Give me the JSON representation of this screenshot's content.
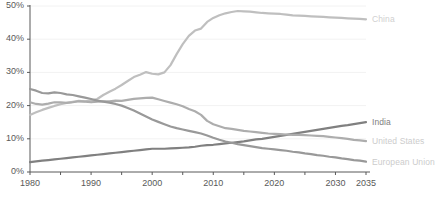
{
  "chart_data": {
    "type": "line",
    "title": "",
    "xlabel": "",
    "ylabel": "",
    "xlim": [
      1980,
      2035
    ],
    "ylim": [
      0,
      50
    ],
    "grid": true,
    "grid_axis": "y",
    "legend_position": "right-inline-end-of-line",
    "y_tick_labels": [
      "0%",
      "10%",
      "20%",
      "30%",
      "40%",
      "50%"
    ],
    "y_ticks": [
      0,
      10,
      20,
      30,
      40,
      50
    ],
    "x_tick_labels": [
      "1980",
      "1990",
      "2000",
      "2010",
      "2020",
      "2030",
      "2035"
    ],
    "x_ticks": [
      1980,
      1990,
      2000,
      2010,
      2020,
      2030,
      2035
    ],
    "x_minor_tick_step": 5,
    "value_unit": "percent",
    "x": [
      1980,
      1981,
      1982,
      1983,
      1984,
      1985,
      1986,
      1987,
      1988,
      1989,
      1990,
      1991,
      1992,
      1993,
      1994,
      1995,
      1996,
      1997,
      1998,
      1999,
      2000,
      2001,
      2002,
      2003,
      2004,
      2005,
      2006,
      2007,
      2008,
      2009,
      2010,
      2011,
      2012,
      2013,
      2014,
      2015,
      2016,
      2017,
      2018,
      2019,
      2020,
      2021,
      2022,
      2023,
      2024,
      2025,
      2026,
      2027,
      2028,
      2029,
      2030,
      2031,
      2032,
      2033,
      2034,
      2035
    ],
    "series": [
      {
        "name": "China",
        "color": "#bfbfbf",
        "label": "China",
        "label_color": "#d0d0d0",
        "values": [
          17.2,
          18.0,
          18.7,
          19.3,
          19.9,
          20.4,
          20.8,
          21.1,
          21.4,
          21.3,
          21.5,
          22.0,
          23.2,
          24.2,
          25.1,
          26.2,
          27.4,
          28.6,
          29.3,
          30.1,
          29.6,
          29.4,
          30.0,
          32.2,
          35.5,
          38.5,
          41.0,
          42.6,
          43.2,
          45.2,
          46.4,
          47.2,
          47.8,
          48.2,
          48.5,
          48.4,
          48.3,
          48.1,
          47.9,
          47.8,
          47.7,
          47.6,
          47.4,
          47.2,
          47.1,
          47.0,
          46.9,
          46.8,
          46.7,
          46.6,
          46.5,
          46.4,
          46.3,
          46.2,
          46.1,
          46.0
        ]
      },
      {
        "name": "India",
        "color": "#808080",
        "label": "India",
        "label_color": "#808080",
        "values": [
          3.0,
          3.2,
          3.4,
          3.6,
          3.8,
          4.0,
          4.2,
          4.4,
          4.6,
          4.8,
          5.0,
          5.2,
          5.4,
          5.6,
          5.8,
          6.0,
          6.2,
          6.4,
          6.6,
          6.8,
          7.0,
          7.0,
          7.0,
          7.1,
          7.2,
          7.3,
          7.4,
          7.6,
          7.9,
          8.1,
          8.2,
          8.4,
          8.6,
          8.8,
          9.0,
          9.2,
          9.5,
          9.8,
          10.0,
          10.3,
          10.6,
          10.9,
          11.2,
          11.5,
          11.8,
          12.1,
          12.4,
          12.7,
          13.0,
          13.3,
          13.6,
          13.9,
          14.1,
          14.4,
          14.7,
          15.0
        ]
      },
      {
        "name": "United States",
        "color": "#adadad",
        "label": "United States",
        "label_color": "#cccccc",
        "values": [
          21.0,
          20.5,
          20.3,
          20.6,
          21.0,
          21.0,
          20.8,
          21.0,
          21.3,
          21.2,
          21.0,
          21.2,
          21.3,
          21.3,
          21.5,
          21.4,
          21.7,
          22.0,
          22.2,
          22.3,
          22.4,
          21.9,
          21.4,
          20.9,
          20.4,
          19.8,
          19.0,
          18.3,
          17.2,
          15.4,
          14.4,
          13.8,
          13.2,
          13.0,
          12.7,
          12.4,
          12.2,
          12.0,
          11.8,
          11.6,
          11.5,
          11.4,
          11.3,
          11.2,
          11.2,
          11.1,
          11.0,
          10.9,
          10.8,
          10.6,
          10.4,
          10.2,
          10.0,
          9.7,
          9.5,
          9.3
        ]
      },
      {
        "name": "European Union",
        "color": "#999999",
        "label": "European Union",
        "label_color": "#cccccc",
        "values": [
          25.0,
          24.5,
          23.8,
          23.7,
          24.0,
          23.8,
          23.4,
          23.2,
          22.8,
          22.4,
          22.0,
          21.5,
          21.2,
          20.9,
          20.5,
          20.0,
          19.3,
          18.5,
          17.6,
          16.7,
          15.8,
          15.1,
          14.4,
          13.7,
          13.2,
          12.8,
          12.4,
          12.0,
          11.6,
          11.0,
          10.3,
          9.7,
          9.2,
          8.8,
          8.4,
          8.1,
          7.8,
          7.5,
          7.2,
          7.0,
          6.8,
          6.6,
          6.4,
          6.1,
          5.9,
          5.6,
          5.4,
          5.1,
          4.9,
          4.6,
          4.4,
          4.1,
          3.9,
          3.6,
          3.4,
          3.1
        ]
      }
    ]
  },
  "axis": {
    "axis_line_color": "#595959",
    "grid_color": "#f2f2f2",
    "tick_text_color": "#595959"
  }
}
